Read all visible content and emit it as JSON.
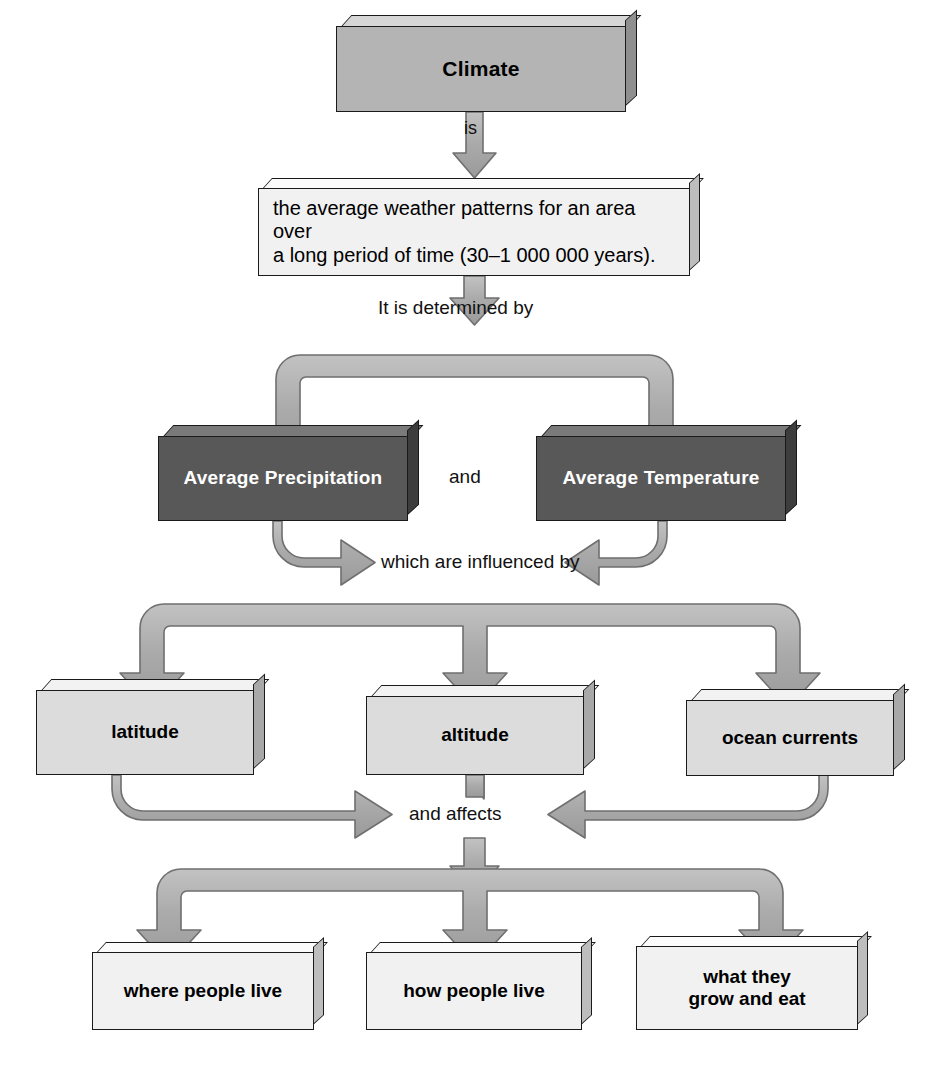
{
  "diagram": {
    "palette": {
      "mid_box": "#b4b4b4",
      "pale_box": "#f1f1f1",
      "dark_box": "#585858",
      "light_box": "#dcdcdc",
      "arrow_fill": "#a9a9a9",
      "arrow_stroke": "#6f6f6f",
      "outline": "#1a1a1a",
      "page_bg": "#ffffff"
    },
    "nodes": {
      "climate": "Climate",
      "definition": "the average weather patterns for an area over\na long period of time (30–1 000 000 years).",
      "avg_precipitation": "Average Precipitation",
      "avg_temperature": "Average Temperature",
      "latitude": "latitude",
      "altitude": "altitude",
      "ocean_currents": "ocean currents",
      "where_people_live": "where people live",
      "how_people_live": "how people live",
      "what_they_grow_and_eat": "what they\ngrow and eat"
    },
    "connector_labels": {
      "is": "is",
      "determined_by": "It is determined by",
      "and": "and",
      "influenced_by": "which are influenced by",
      "and_affects": "and affects"
    },
    "caption": ""
  }
}
